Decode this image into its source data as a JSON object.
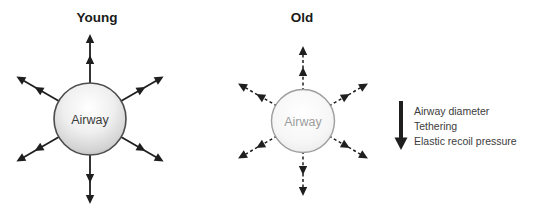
{
  "diagram": {
    "panels": [
      {
        "title": "Young",
        "circle_label": "Airway",
        "arrow_style": "solid"
      },
      {
        "title": "Old",
        "circle_label": "Airway",
        "arrow_style": "dashed"
      }
    ],
    "legend": {
      "arrow_direction": "down",
      "items": [
        "Airway diameter",
        "Tethering",
        "Elastic recoil pressure"
      ]
    },
    "colors": {
      "background": "#ffffff",
      "arrow": "#1f1f1f",
      "title_text": "#1a1a1a",
      "legend_text": "#3c3c3c",
      "young_label": "#3b3b3b",
      "old_label": "#9d9d9d",
      "young_circle_stroke": "#4b4b4b",
      "old_circle_stroke": "#9e9e9e"
    }
  }
}
